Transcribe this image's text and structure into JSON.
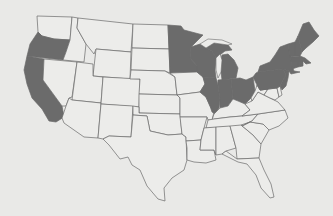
{
  "map": {
    "title": "",
    "region": "Contiguous United States",
    "colors": {
      "background": "#e9e9e7",
      "highlighted": "#6b6b6b",
      "unhighlighted": "#ececea",
      "border": "#6a6a6a"
    },
    "highlighted_states": [
      "Oregon",
      "California",
      "Minnesota",
      "Wisconsin",
      "Michigan",
      "Illinois",
      "Indiana",
      "Ohio",
      "Pennsylvania",
      "New York",
      "New Jersey",
      "Vermont",
      "New Hampshire",
      "Maine",
      "Massachusetts",
      "Connecticut",
      "Rhode Island"
    ],
    "states": [
      {
        "id": "WA",
        "name": "Washington",
        "on": false,
        "d": "M37,16 L72,17 L70,40 L54,39 L42,36 L38,32 Z"
      },
      {
        "id": "OR",
        "name": "Oregon",
        "on": true,
        "d": "M38,32 L42,36 L54,39 L70,40 L66,52 L63,60 L27,56 L30,44 Z"
      },
      {
        "id": "CA",
        "name": "California",
        "on": true,
        "d": "M27,56 L44,59 L43,80 L62,106 L64,117 L56,122 L49,121 L42,109 L32,98 L27,84 L24,70 Z"
      },
      {
        "id": "ID",
        "name": "Idaho",
        "on": false,
        "d": "M72,17 L78,18 L77,28 L86,44 L84,62 L63,60 L66,52 L70,40 Z"
      },
      {
        "id": "NV",
        "name": "Nevada",
        "on": false,
        "d": "M44,59 L77,62 L72,97 L69,98 L66,106 L62,106 L43,80 Z"
      },
      {
        "id": "MT",
        "name": "Montana",
        "on": false,
        "d": "M78,18 L133,24 L131,52 L96,49 L94,54 L86,44 L77,28 Z"
      },
      {
        "id": "WY",
        "name": "Wyoming",
        "on": false,
        "d": "M96,49 L131,52 L130,79 L93,76 Z"
      },
      {
        "id": "UT",
        "name": "Utah",
        "on": false,
        "d": "M77,62 L93,64 L93,76 L103,77 L101,103 L72,100 Z"
      },
      {
        "id": "AZ",
        "name": "Arizona",
        "on": false,
        "d": "M72,100 L101,103 L98,138 L84,137 L64,123 L62,118 L66,106 L69,98 Z"
      },
      {
        "id": "CO",
        "name": "Colorado",
        "on": false,
        "d": "M103,77 L140,79 L139,107 L101,104 Z"
      },
      {
        "id": "NM",
        "name": "New Mexico",
        "on": false,
        "d": "M101,104 L133,106 L131,137 L109,136 L103,139 L98,138 Z"
      },
      {
        "id": "ND",
        "name": "North Dakota",
        "on": false,
        "d": "M133,24 L168,25 L169,49 L132,48 Z"
      },
      {
        "id": "SD",
        "name": "South Dakota",
        "on": false,
        "d": "M132,48 L169,49 L170,73 L165,71 L131,70 Z"
      },
      {
        "id": "NE",
        "name": "Nebraska",
        "on": false,
        "d": "M131,70 L165,71 L175,77 L177,95 L139,94 L140,79 L130,79 Z"
      },
      {
        "id": "KS",
        "name": "Kansas",
        "on": false,
        "d": "M139,94 L177,95 L180,98 L180,114 L139,113 Z"
      },
      {
        "id": "OK",
        "name": "Oklahoma",
        "on": false,
        "d": "M133,106 L139,107 L139,113 L180,114 L182,134 L168,135 L150,131 L147,116 L133,115 Z"
      },
      {
        "id": "TX",
        "name": "Texas",
        "on": false,
        "d": "M133,115 L147,116 L150,131 L168,135 L182,134 L186,137 L187,160 L184,170 L172,178 L164,188 L165,201 L158,199 L147,186 L140,170 L132,165 L128,157 L120,159 L109,145 L103,139 L109,136 L131,137 Z"
      },
      {
        "id": "MN",
        "name": "Minnesota",
        "on": true,
        "d": "M168,25 L181,26 L184,30 L203,35 L191,47 L190,58 L197,66 L197,72 L170,73 L169,49 Z"
      },
      {
        "id": "IA",
        "name": "Iowa",
        "on": false,
        "d": "M170,73 L197,72 L203,77 L205,84 L200,92 L177,95 L175,77 Z"
      },
      {
        "id": "MO",
        "name": "Missouri",
        "on": false,
        "d": "M177,95 L200,92 L206,97 L210,106 L214,112 L212,120 L208,120 L207,117 L180,117 L180,98 Z"
      },
      {
        "id": "AR",
        "name": "Arkansas",
        "on": false,
        "d": "M180,117 L207,117 L204,128 L201,140 L186,141 L186,137 L182,134 Z"
      },
      {
        "id": "LA",
        "name": "Louisiana",
        "on": false,
        "d": "M186,141 L201,140 L200,150 L214,150 L216,160 L206,163 L194,162 L187,160 L187,148 Z"
      },
      {
        "id": "WI",
        "name": "Wisconsin",
        "on": true,
        "d": "M191,47 L200,44 L206,48 L212,51 L216,58 L215,70 L216,78 L203,77 L197,72 L197,66 L190,58 Z"
      },
      {
        "id": "IL",
        "name": "Illinois",
        "on": true,
        "d": "M203,77 L216,78 L218,85 L220,100 L219,108 L215,114 L212,112 L210,106 L206,97 L200,92 L205,84 Z"
      },
      {
        "id": "MI",
        "name": "Michigan",
        "on": true,
        "d": "M206,48 L214,43 L228,45 L232,50 L225,51 L216,58 L212,51 Z M222,55 L228,54 L234,60 L238,68 L236,78 L222,80 L221,72 L220,63 Z"
      },
      {
        "id": "IN",
        "name": "Indiana",
        "on": true,
        "d": "M218,80 L231,79 L233,99 L228,106 L220,108 L220,100 L218,85 Z"
      },
      {
        "id": "OH",
        "name": "Ohio",
        "on": true,
        "d": "M231,79 L240,78 L246,80 L253,77 L255,91 L251,98 L245,104 L238,101 L233,99 Z"
      },
      {
        "id": "KY",
        "name": "Kentucky",
        "on": false,
        "d": "M212,120 L214,114 L220,108 L228,106 L233,99 L238,101 L245,104 L250,110 L242,116 L230,117 L214,119 Z"
      },
      {
        "id": "TN",
        "name": "Tennessee",
        "on": false,
        "d": "M208,120 L214,119 L230,117 L242,116 L258,114 L252,121 L242,126 L206,128 Z"
      },
      {
        "id": "MS",
        "name": "Mississippi",
        "on": false,
        "d": "M204,128 L216,127 L216,155 L214,150 L200,150 L201,140 Z"
      },
      {
        "id": "AL",
        "name": "Alabama",
        "on": false,
        "d": "M216,127 L230,126 L236,148 L226,151 L222,154 L216,155 Z"
      },
      {
        "id": "GA",
        "name": "Georgia",
        "on": false,
        "d": "M230,126 L241,125 L253,135 L261,144 L259,158 L237,159 L236,148 Z"
      },
      {
        "id": "FL",
        "name": "Florida",
        "on": false,
        "d": "M222,154 L226,151 L237,159 L259,158 L264,170 L271,184 L274,197 L270,198 L261,188 L256,175 L247,164 L238,162 Z"
      },
      {
        "id": "SC",
        "name": "South Carolina",
        "on": false,
        "d": "M241,125 L250,122 L263,124 L269,130 L261,144 L253,135 Z"
      },
      {
        "id": "NC",
        "name": "North Carolina",
        "on": false,
        "d": "M242,126 L252,121 L258,114 L285,110 L288,118 L279,126 L269,130 L263,124 L250,122 Z"
      },
      {
        "id": "VA",
        "name": "Virginia",
        "on": false,
        "d": "M245,104 L252,101 L258,92 L264,95 L270,98 L278,102 L285,110 L258,114 L242,116 L250,110 Z"
      },
      {
        "id": "WV",
        "name": "West Virginia",
        "on": false,
        "d": "M251,98 L255,91 L257,85 L260,90 L268,89 L264,95 L258,92 L252,101 Z"
      },
      {
        "id": "MD",
        "name": "Maryland",
        "on": false,
        "d": "M260,90 L277,88 L279,97 L275,100 L270,98 L264,95 L268,89 Z"
      },
      {
        "id": "DE",
        "name": "Delaware",
        "on": false,
        "d": "M277,88 L280,86 L282,95 L279,97 Z"
      },
      {
        "id": "PA",
        "name": "Pennsylvania",
        "on": true,
        "d": "M253,77 L256,73 L258,72 L283,69 L286,75 L283,80 L280,86 L277,88 L260,90 L257,85 Z"
      },
      {
        "id": "NJ",
        "name": "New Jersey",
        "on": true,
        "d": "M283,69 L289,71 L288,78 L286,86 L282,90 L280,86 L283,80 L286,75 Z"
      },
      {
        "id": "NY",
        "name": "New York",
        "on": true,
        "d": "M258,72 L260,66 L270,62 L275,55 L280,47 L288,44 L290,55 L292,66 L294,71 L300,72 L291,74 L289,71 L283,69 Z"
      },
      {
        "id": "VT",
        "name": "Vermont",
        "on": true,
        "d": "M288,44 L295,42 L295,56 L290,57 Z"
      },
      {
        "id": "NH",
        "name": "New Hampshire",
        "on": true,
        "d": "M295,42 L298,36 L302,52 L300,56 L295,56 Z"
      },
      {
        "id": "ME",
        "name": "Maine",
        "on": true,
        "d": "M298,36 L303,24 L309,22 L314,30 L319,36 L313,42 L306,48 L302,52 Z"
      },
      {
        "id": "MA",
        "name": "Massachusetts",
        "on": true,
        "d": "M290,57 L300,56 L305,58 L311,63 L306,64 L303,61 L291,61 Z"
      },
      {
        "id": "CT",
        "name": "Connecticut",
        "on": true,
        "d": "M291,61 L298,61 L298,67 L292,69 Z"
      },
      {
        "id": "RI",
        "name": "Rhode Island",
        "on": true,
        "d": "M298,61 L303,61 L303,66 L298,67 Z"
      }
    ],
    "lakes": [
      {
        "name": "Lake Superior",
        "d": "M200,44 L208,39 L222,40 L232,44 L228,45 L214,43 L206,48 Z"
      },
      {
        "name": "Lake Michigan",
        "d": "M216,58 L220,54 L222,60 L221,72 L218,78 L216,70 Z"
      }
    ]
  }
}
